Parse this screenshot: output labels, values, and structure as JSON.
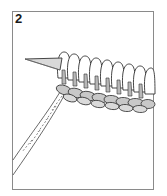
{
  "figure": {
    "step_number": "2",
    "colors": {
      "frame": "#8a8a8a",
      "outline": "#333333",
      "yarn_fill": "#c8c8c8",
      "loop_fill": "#ffffff",
      "needle_fill": "#d9d9d9"
    }
  }
}
